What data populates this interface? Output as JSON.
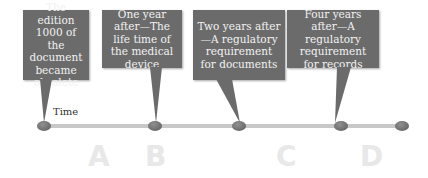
{
  "diagram": {
    "timeline_label": "Time",
    "events": [
      {
        "id": "A",
        "text": "The edition 1000 of the document became obsolete"
      },
      {
        "id": "B",
        "text": "One year after—The life time of the medical device"
      },
      {
        "id": "C",
        "text": "Two years after—A regulatory requirement for documents"
      },
      {
        "id": "D",
        "text": "Four years after—A regulatory requirement for records"
      }
    ],
    "letters": [
      "A",
      "B",
      "C",
      "D"
    ],
    "colors": {
      "callout": "#6b6b6b",
      "callout_text": "#f2f2f2",
      "timeline": "#c8c8c8",
      "dot": "#707070",
      "letters": "#e8e8e8"
    }
  }
}
